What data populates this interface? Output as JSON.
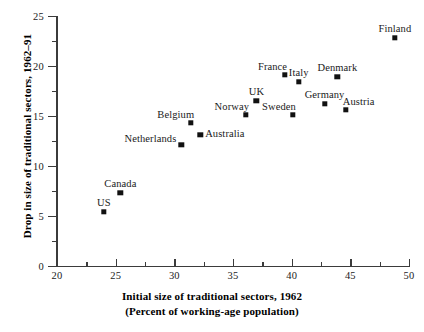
{
  "chart_data": {
    "type": "scatter",
    "title": "",
    "xlabel": "Initial size of traditional sectors, 1962 (Percent of working-age population)",
    "ylabel": "Drop in size of traditional sectors, 1962–91",
    "xlim": [
      20,
      50
    ],
    "ylim": [
      0,
      25
    ],
    "x_major_ticks": [
      20,
      25,
      30,
      35,
      40,
      45,
      50
    ],
    "x_minor_ticks": [
      22.5,
      27.5,
      32.5,
      37.5,
      42.5,
      47.5
    ],
    "y_major_ticks": [
      0,
      5,
      10,
      15,
      20,
      25
    ],
    "y_minor_ticks": [
      2.5,
      7.5,
      12.5,
      17.5,
      22.5
    ],
    "grid": false,
    "legend": "none",
    "marker": "filled-square",
    "marker_color": "#111111",
    "points": [
      {
        "label": "US",
        "x": 24.0,
        "y": 5.4,
        "label_pos": "above"
      },
      {
        "label": "Canada",
        "x": 25.4,
        "y": 7.3,
        "label_pos": "above"
      },
      {
        "label": "Netherlands",
        "x": 30.6,
        "y": 12.1,
        "label_pos": "left"
      },
      {
        "label": "Belgium",
        "x": 31.4,
        "y": 14.3,
        "label_pos": "above-left"
      },
      {
        "label": "Australia",
        "x": 32.2,
        "y": 13.1,
        "label_pos": "right"
      },
      {
        "label": "Norway",
        "x": 36.1,
        "y": 15.1,
        "label_pos": "above-left"
      },
      {
        "label": "UK",
        "x": 37.0,
        "y": 16.5,
        "label_pos": "above"
      },
      {
        "label": "France",
        "x": 39.4,
        "y": 19.1,
        "label_pos": "above-left"
      },
      {
        "label": "Sweden",
        "x": 40.1,
        "y": 15.1,
        "label_pos": "above-left"
      },
      {
        "label": "Italy",
        "x": 40.6,
        "y": 18.4,
        "label_pos": "above"
      },
      {
        "label": "Germany",
        "x": 42.8,
        "y": 16.2,
        "label_pos": "above"
      },
      {
        "label": "Denmark",
        "x": 43.9,
        "y": 18.9,
        "label_pos": "above"
      },
      {
        "label": "Austria",
        "x": 44.6,
        "y": 15.6,
        "label_pos": "above-right"
      },
      {
        "label": "Finland",
        "x": 48.8,
        "y": 22.8,
        "label_pos": "above"
      }
    ]
  },
  "axes": {
    "y_title": "Drop in size of traditional sectors, 1962–91",
    "x_title_line1": "Initial size of traditional sectors, 1962",
    "x_title_line2": "(Percent of working-age population)"
  },
  "colors": {
    "marker": "#111111",
    "axis": "#3b3b3b",
    "text": "#1a1a1a",
    "background": "#ffffff"
  }
}
